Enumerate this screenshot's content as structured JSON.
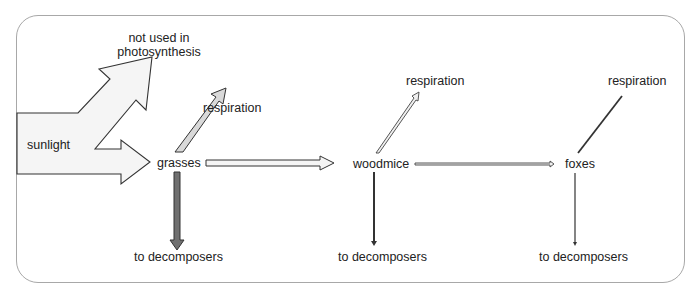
{
  "diagram": {
    "nodes": {
      "sunlight": "sunlight",
      "not_used": [
        "not used in",
        "photosynthesis"
      ],
      "grasses": "grasses",
      "woodmice": "woodmice",
      "foxes": "foxes"
    },
    "labels": {
      "respiration_1": "respiration",
      "respiration_2": "respiration",
      "respiration_3": "respiration",
      "decomposers_1": "to decomposers",
      "decomposers_2": "to decomposers",
      "decomposers_3": "to decomposers"
    },
    "colors": {
      "border": "#a8a8a8",
      "arrow_outline": "#3a3a3a",
      "arrow_fill_light": "#f4f4f4",
      "respiration_fill": "#d8d8d8",
      "decomposer_fill": "#707070"
    }
  }
}
